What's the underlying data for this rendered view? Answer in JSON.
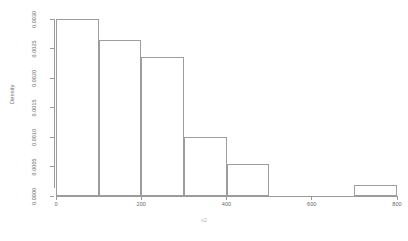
{
  "chart_data": {
    "type": "bar",
    "title": "",
    "subtitle": "",
    "xlabel": "x2",
    "ylabel": "Density",
    "grid": false,
    "legend": "none",
    "xlim": [
      0,
      800
    ],
    "ylim": [
      0.0,
      0.003
    ],
    "bin_width": 100,
    "bin_edges": [
      0,
      100,
      200,
      300,
      400,
      500,
      600,
      700,
      800
    ],
    "categories": [
      "0-100",
      "100-200",
      "200-300",
      "300-400",
      "400-500",
      "500-600",
      "600-700",
      "700-800"
    ],
    "values": [
      0.003,
      0.00265,
      0.00235,
      0.001,
      0.00055,
      0.0,
      0.0,
      0.00018
    ],
    "xticks": [
      0,
      200,
      400,
      600,
      800
    ],
    "xtick_labels": [
      "0",
      "200",
      "400",
      "600",
      "800"
    ],
    "yticks": [
      0.0,
      0.0005,
      0.001,
      0.0015,
      0.002,
      0.0025,
      0.003
    ],
    "ytick_labels": [
      "0.0000",
      "0.0005",
      "0.0010",
      "0.0015",
      "0.0020",
      "0.0025",
      "0.0030"
    ],
    "colors": {
      "bar_border": "#9d9d9d",
      "bar_fill": "transparent",
      "axis": "#9a9a9a",
      "text": "#6a6a6a",
      "background": "#ffffff"
    }
  }
}
